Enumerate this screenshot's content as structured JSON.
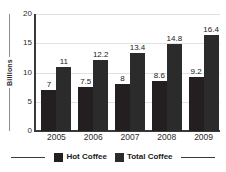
{
  "chart_data": {
    "type": "bar",
    "title": "",
    "subtitle": "",
    "xlabel": "",
    "ylabel": "Billions",
    "categories": [
      "2005",
      "2006",
      "2007",
      "2008",
      "2009"
    ],
    "series": [
      {
        "name": "Hot Coffee",
        "color": "#231f20",
        "values": [
          7,
          7.5,
          8,
          8.6,
          9.2
        ],
        "labels": [
          "7",
          "7.5",
          "8",
          "8.6",
          "9.2"
        ]
      },
      {
        "name": "Total Coffee",
        "color": "#2b2b2b",
        "values": [
          11,
          12.2,
          13.4,
          14.8,
          16.4
        ],
        "labels": [
          "11",
          "12.2",
          "13.4",
          "14.8",
          "16.4"
        ]
      }
    ],
    "ylim": [
      0,
      20
    ],
    "yticks": [
      0,
      5,
      10,
      15,
      20
    ],
    "ytick_labels": [
      "0",
      "5",
      "10",
      "15",
      "20"
    ],
    "grid": true,
    "grid_color": "#e2e2e2",
    "legend_position": "bottom",
    "axis_color": "#3a3a3a",
    "background": "#ffffff"
  },
  "axis": {
    "y_title": "Billions"
  },
  "legend": {
    "items": [
      {
        "label": "Hot Coffee",
        "color": "#231f20"
      },
      {
        "label": "Total Coffee",
        "color": "#2b2b2b"
      }
    ]
  }
}
